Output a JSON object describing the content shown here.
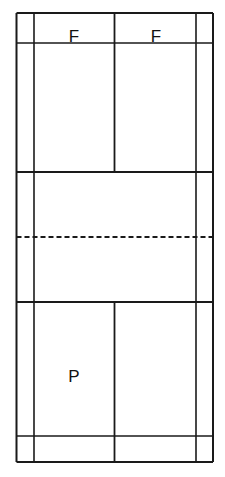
{
  "diagram": {
    "type": "court-diagram",
    "background_color": "#ffffff",
    "line_color": "#1a1a1a",
    "canvas": {
      "width": 225,
      "height": 477
    },
    "labels": [
      {
        "id": "label-f-left",
        "text": "F",
        "x": 74,
        "y": 42
      },
      {
        "id": "label-f-right",
        "text": "F",
        "x": 156,
        "y": 42
      },
      {
        "id": "label-p",
        "text": "P",
        "x": 74,
        "y": 382
      }
    ],
    "vertical_lines": [
      {
        "id": "left-outer-sideline",
        "x": 16.5,
        "y1": 13,
        "y2": 462,
        "width": 2.0,
        "dashed": false
      },
      {
        "id": "left-inner-sideline",
        "x": 34,
        "y1": 13,
        "y2": 462,
        "width": 1.6,
        "dashed": false
      },
      {
        "id": "centre-line-top",
        "x": 114.5,
        "y1": 13,
        "y2": 172,
        "width": 1.8,
        "dashed": false
      },
      {
        "id": "centre-line-bottom",
        "x": 114.5,
        "y1": 302,
        "y2": 462,
        "width": 1.8,
        "dashed": false
      },
      {
        "id": "right-inner-sideline",
        "x": 196,
        "y1": 13,
        "y2": 462,
        "width": 1.6,
        "dashed": false
      },
      {
        "id": "right-outer-sideline",
        "x": 213,
        "y1": 13,
        "y2": 462,
        "width": 2.0,
        "dashed": false
      }
    ],
    "horizontal_lines": [
      {
        "id": "top-baseline",
        "y": 13,
        "x1": 16.5,
        "x2": 213,
        "width": 2.0,
        "dashed": false
      },
      {
        "id": "top-doubles-long-service",
        "y": 43,
        "x1": 16.5,
        "x2": 213,
        "width": 1.6,
        "dashed": false
      },
      {
        "id": "top-short-service-line",
        "y": 172,
        "x1": 16.5,
        "x2": 213,
        "width": 2.0,
        "dashed": false
      },
      {
        "id": "net-line",
        "y": 237,
        "x1": 16.5,
        "x2": 213,
        "width": 1.8,
        "dashed": true
      },
      {
        "id": "bottom-short-service-line",
        "y": 302,
        "x1": 16.5,
        "x2": 213,
        "width": 2.0,
        "dashed": false
      },
      {
        "id": "bottom-doubles-long-service",
        "y": 436,
        "x1": 16.5,
        "x2": 213,
        "width": 1.6,
        "dashed": false
      },
      {
        "id": "bottom-baseline",
        "y": 462,
        "x1": 16.5,
        "x2": 213,
        "width": 2.0,
        "dashed": false
      }
    ],
    "dash_pattern": "5 3"
  }
}
